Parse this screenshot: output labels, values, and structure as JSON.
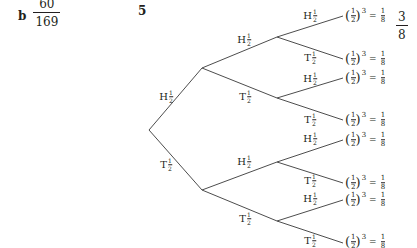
{
  "part_b": {
    "label": "b",
    "answer": {
      "numerator": "60",
      "denominator": "169"
    }
  },
  "question_5": {
    "number": "5",
    "answer": {
      "numerator": "3",
      "denominator": "8"
    },
    "tree": {
      "branch_prob": {
        "numerator": "1",
        "denominator": "2"
      },
      "level1": [
        {
          "outcome": "H",
          "label": "H"
        },
        {
          "outcome": "T",
          "label": "T"
        }
      ],
      "level2": [
        {
          "outcome": "H",
          "label": "T"
        },
        {
          "outcome": "T",
          "label": "T"
        },
        {
          "outcome": "H",
          "label": "H"
        },
        {
          "outcome": "T",
          "label": "T"
        }
      ],
      "level3": [
        {
          "label": "H"
        },
        {
          "label": "T"
        },
        {
          "label": "H"
        },
        {
          "label": "T"
        },
        {
          "label": "H"
        },
        {
          "label": "T"
        },
        {
          "label": "H"
        },
        {
          "label": "T"
        }
      ],
      "leaf_expression": {
        "base_numerator": "1",
        "base_denominator": "2",
        "exponent": "3",
        "equals": "=",
        "result_numerator": "1",
        "result_denominator": "8"
      }
    }
  },
  "colors": {
    "text": "#231f20",
    "line": "#4d4d4d",
    "background": "#ffffff"
  }
}
